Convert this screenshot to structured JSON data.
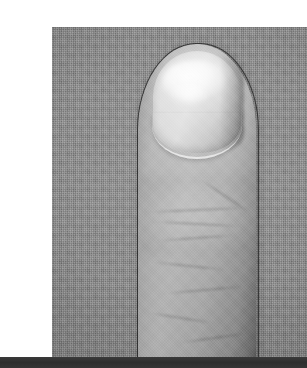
{
  "page": {
    "background_color": "#ffffff",
    "width": 307,
    "height": 368
  },
  "figure": {
    "name": "fingertip-macro-photograph",
    "kind": "photograph",
    "color_mode": "grayscale",
    "orientation": "portrait",
    "caption": "",
    "frame": {
      "left": 12,
      "top": 11,
      "width": 285,
      "height": 336
    },
    "background": {
      "name": "woven-fabric-backdrop",
      "description": "flat gray woven canvas / linen texture",
      "color": "#8e8e8e"
    },
    "subject_colors": {
      "skin_light": "#c9c9c9",
      "skin_mid": "#aeaeae",
      "skin_shadow": "#9e9e9e",
      "contour_line": "#1a1a1a",
      "nail_plate": "#d4d4d4",
      "nail_highlight": "#ffffff"
    },
    "parts": [
      {
        "name": "fingertip",
        "label": ""
      },
      {
        "name": "fingernail",
        "label": ""
      },
      {
        "name": "nail-specular-highlight",
        "label": ""
      },
      {
        "name": "cuticle-line",
        "label": ""
      },
      {
        "name": "skin-creases",
        "label": ""
      }
    ]
  },
  "bottom_bar": {
    "name": "bottom-rule",
    "color": "#333333",
    "top": 357,
    "height": 11,
    "label": ""
  }
}
